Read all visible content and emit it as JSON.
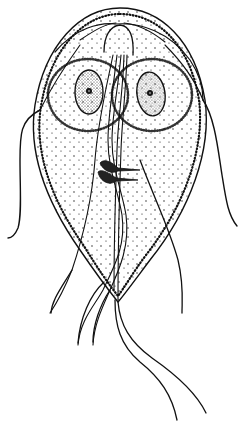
{
  "illustration": {
    "subject": "flagellate protozoan trophozoite line drawing",
    "style": "black ink stipple drawing on white",
    "colors": {
      "ink": "#111111",
      "background": "#ffffff"
    },
    "parts": [
      "body-outline",
      "ventral-disc",
      "left-nucleus",
      "right-nucleus",
      "axonemes",
      "median-bodies",
      "anterior-flagella",
      "posterior-lateral-flagella",
      "ventral-flagella",
      "caudal-flagella"
    ]
  }
}
